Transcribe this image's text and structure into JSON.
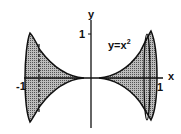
{
  "diagram": {
    "type": "solid-of-revolution",
    "curve_label": "y=x",
    "curve_exponent": "2",
    "x_axis_label": "x",
    "y_axis_label": "y",
    "y_tick_label": "1",
    "x_tick_left": "-1",
    "x_tick_right": "1",
    "fill_color": "#9a9a9a",
    "stroke_color": "#111111"
  }
}
